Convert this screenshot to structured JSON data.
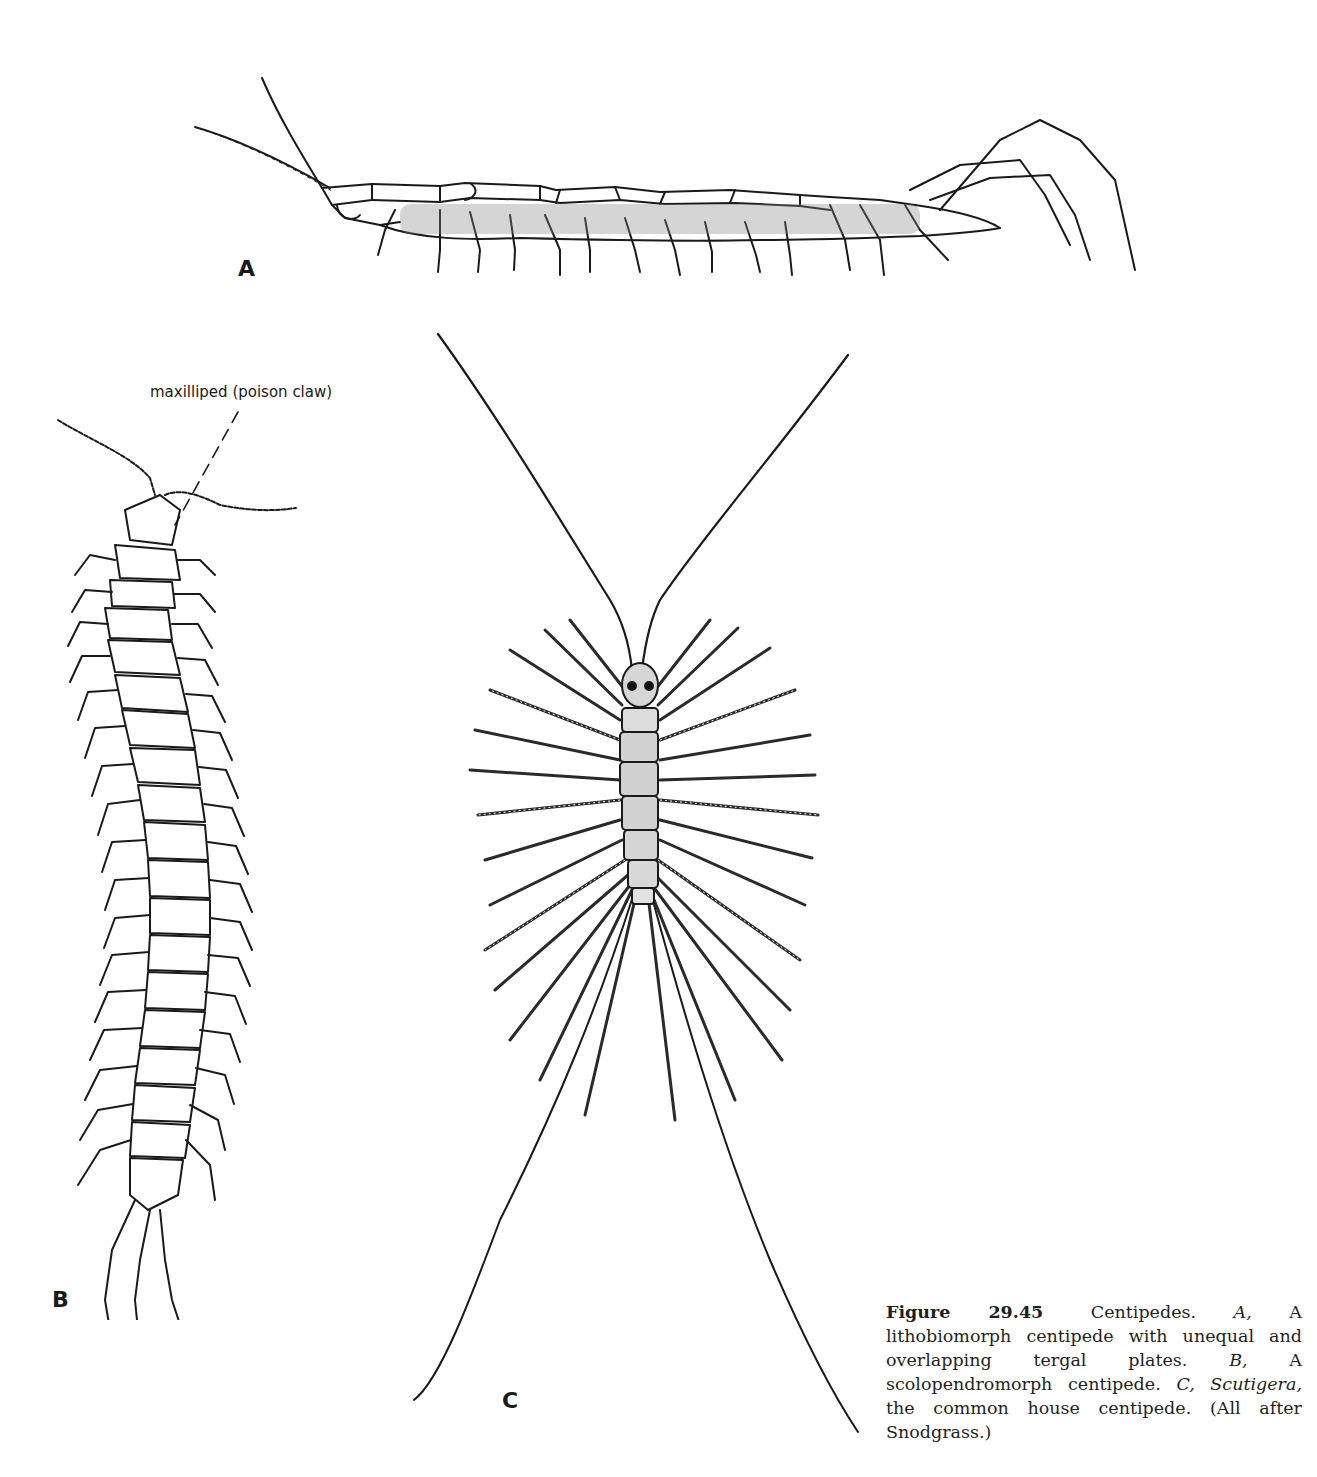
{
  "figure": {
    "panels": [
      {
        "id": "A",
        "label": "A",
        "description": "Lithobiomorph centipede, lateral view"
      },
      {
        "id": "B",
        "label": "B",
        "description": "Scolopendromorph centipede, dorsal view"
      },
      {
        "id": "C",
        "label": "C",
        "description": "Scutigera, the common house centipede, dorsal view"
      }
    ],
    "callouts": [
      {
        "panel": "B",
        "text": "maxilliped (poison claw)"
      }
    ],
    "caption": {
      "figure_number": "Figure 29.45",
      "title": "Centipedes.",
      "part_a_key": "A,",
      "part_a_text": "A lithobiomorph centipede with unequal and overlapping tergal plates.",
      "part_b_key": "B,",
      "part_b_text": "A scolopendromorph centipede.",
      "part_c_key": "C,",
      "part_c_genus": "Scutigera,",
      "part_c_text": "the common house centipede.",
      "credit": "(All after Snodgrass.)"
    }
  }
}
